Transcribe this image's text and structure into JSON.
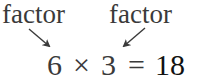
{
  "labels": {
    "left": "factor",
    "right": "factor"
  },
  "equation": {
    "factor_a": "6",
    "times": "×",
    "factor_b": "3",
    "equals": "=",
    "product": "18"
  },
  "colors": {
    "text": "#3a3a3a",
    "product": "#111111",
    "arrow": "#3a3a3a"
  }
}
